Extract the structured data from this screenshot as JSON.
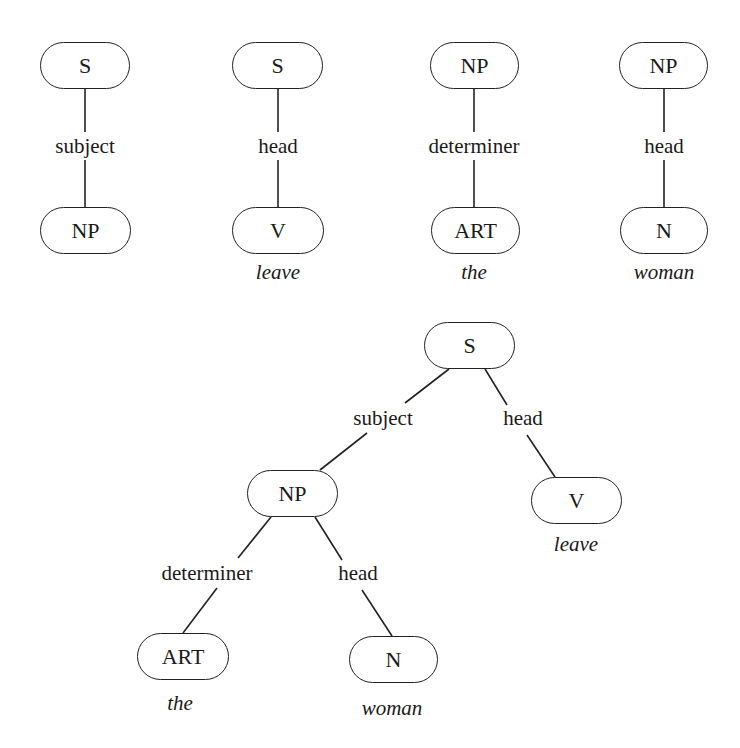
{
  "diagram": {
    "type": "dependency-tree-fragments-and-combined-tree",
    "fragments": [
      {
        "parent": "S",
        "relation": "subject",
        "child": "NP",
        "word": ""
      },
      {
        "parent": "S",
        "relation": "head",
        "child": "V",
        "word": "leave"
      },
      {
        "parent": "NP",
        "relation": "determiner",
        "child": "ART",
        "word": "the"
      },
      {
        "parent": "NP",
        "relation": "head",
        "child": "N",
        "word": "woman"
      }
    ],
    "combined_tree": {
      "root": "S",
      "root_edges": [
        {
          "relation": "subject",
          "child": "NP"
        },
        {
          "relation": "head",
          "child": "V",
          "word": "leave"
        }
      ],
      "np_edges": [
        {
          "relation": "determiner",
          "child": "ART",
          "word": "the"
        },
        {
          "relation": "head",
          "child": "N",
          "word": "woman"
        }
      ]
    }
  }
}
